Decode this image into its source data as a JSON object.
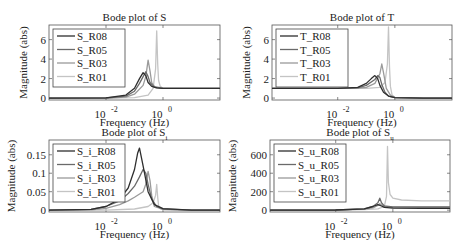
{
  "figure": {
    "background": "#ffffff",
    "series_colors": [
      "#2e2e2e",
      "#6a6a6a",
      "#9a9a9a",
      "#c4c4c4"
    ]
  },
  "chart_data": [
    {
      "type": "line",
      "id": "S",
      "title": "Bode plot of S",
      "xlabel": "Frequency  (Hz)",
      "ylabel": "Magnitude (abs)",
      "xscale": "log",
      "xlim": [
        0.0001,
        100
      ],
      "ylim": [
        -0.2,
        7.5
      ],
      "xticks": [
        {
          "value": 0.01,
          "label": "10",
          "exp": "-2"
        },
        {
          "value": 1,
          "label": "10",
          "exp": "0"
        }
      ],
      "yticks": [
        0,
        2,
        4,
        6
      ],
      "legend": [
        "S_R08",
        "S_R05",
        "S_R03",
        "S_R01"
      ],
      "legend_position": "upper left",
      "series": [
        {
          "name": "S_R08",
          "x": [
            0.0001,
            0.01,
            0.05,
            0.1,
            0.15,
            0.2,
            0.25,
            0.3,
            0.4,
            0.6,
            1,
            10,
            100
          ],
          "values": [
            0,
            0.02,
            0.3,
            1.0,
            2.0,
            2.6,
            2.3,
            1.6,
            1.2,
            1.05,
            1.0,
            1.0,
            1.0
          ]
        },
        {
          "name": "S_R05",
          "x": [
            0.0001,
            0.01,
            0.05,
            0.1,
            0.15,
            0.2,
            0.25,
            0.3,
            0.35,
            0.5,
            1,
            10,
            100
          ],
          "values": [
            0,
            0.01,
            0.2,
            0.7,
            1.5,
            2.2,
            2.7,
            2.2,
            1.6,
            1.1,
            1.0,
            1.0,
            1.0
          ]
        },
        {
          "name": "S_R03",
          "x": [
            0.0001,
            0.01,
            0.05,
            0.1,
            0.2,
            0.25,
            0.3,
            0.35,
            0.4,
            0.5,
            1,
            10,
            100
          ],
          "values": [
            0,
            0.01,
            0.1,
            0.4,
            1.3,
            2.2,
            3.9,
            2.8,
            1.6,
            1.2,
            1.0,
            1.0,
            1.0
          ]
        },
        {
          "name": "S_R01",
          "x": [
            0.0001,
            0.01,
            0.1,
            0.3,
            0.45,
            0.55,
            0.6,
            0.65,
            0.7,
            0.8,
            1,
            10,
            100
          ],
          "values": [
            0,
            0.0,
            0.05,
            0.3,
            1.0,
            3.0,
            6.9,
            3.5,
            1.8,
            1.2,
            1.0,
            1.0,
            1.0
          ]
        }
      ]
    },
    {
      "type": "line",
      "id": "T",
      "title": "Bode plot of T",
      "xlabel": "Frequency  (Hz)",
      "ylabel": "Magnitude (abs)",
      "xscale": "log",
      "xlim": [
        5e-05,
        100
      ],
      "ylim": [
        -0.2,
        7.5
      ],
      "xticks": [
        {
          "value": 0.01,
          "label": "10",
          "exp": "-2"
        },
        {
          "value": 1,
          "label": "10",
          "exp": "0"
        }
      ],
      "yticks": [
        0,
        2,
        4,
        6
      ],
      "legend": [
        "T_R08",
        "T_R05",
        "T_R03",
        "T_R01"
      ],
      "legend_position": "upper left",
      "series": [
        {
          "name": "T_R08",
          "x": [
            5e-05,
            0.01,
            0.05,
            0.1,
            0.15,
            0.2,
            0.25,
            0.3,
            0.4,
            0.6,
            1,
            10,
            100
          ],
          "values": [
            1.0,
            1.0,
            1.1,
            1.5,
            2.0,
            2.3,
            2.0,
            1.3,
            0.6,
            0.2,
            0.05,
            0,
            0
          ]
        },
        {
          "name": "T_R05",
          "x": [
            5e-05,
            0.01,
            0.05,
            0.1,
            0.2,
            0.25,
            0.3,
            0.35,
            0.45,
            0.6,
            1,
            10,
            100
          ],
          "values": [
            1.0,
            1.0,
            1.05,
            1.3,
            1.9,
            2.3,
            2.1,
            1.4,
            0.6,
            0.2,
            0.05,
            0,
            0
          ]
        },
        {
          "name": "T_R03",
          "x": [
            5e-05,
            0.01,
            0.05,
            0.1,
            0.2,
            0.3,
            0.35,
            0.4,
            0.5,
            0.7,
            1,
            10,
            100
          ],
          "values": [
            1.0,
            1.0,
            1.02,
            1.1,
            1.5,
            2.5,
            3.5,
            2.6,
            1.0,
            0.3,
            0.05,
            0,
            0
          ]
        },
        {
          "name": "T_R01",
          "x": [
            5e-05,
            0.01,
            0.1,
            0.3,
            0.45,
            0.55,
            0.6,
            0.65,
            0.7,
            0.8,
            1,
            10,
            100
          ],
          "values": [
            1.0,
            1.0,
            1.0,
            1.1,
            1.6,
            3.5,
            7.3,
            3.2,
            1.2,
            0.3,
            0.05,
            0,
            0
          ]
        }
      ]
    },
    {
      "type": "line",
      "id": "S_i",
      "title": "Bode plot of S",
      "title_subscript": "i",
      "xlabel": "Frequency  (Hz)",
      "ylabel": "Magnitude (abs)",
      "xscale": "log",
      "xlim": [
        0.0001,
        100
      ],
      "ylim": [
        -0.005,
        0.19
      ],
      "xticks": [
        {
          "value": 0.01,
          "label": "10",
          "exp": "-2"
        },
        {
          "value": 1,
          "label": "10",
          "exp": "0"
        }
      ],
      "yticks": [
        0,
        0.05,
        0.1,
        0.15
      ],
      "legend": [
        "S_i_R08",
        "S_i_R05",
        "S_i_R03",
        "S_i_R01"
      ],
      "legend_position": "upper left",
      "series": [
        {
          "name": "S_i_R08",
          "x": [
            0.0001,
            0.003,
            0.01,
            0.03,
            0.06,
            0.1,
            0.13,
            0.15,
            0.2,
            0.3,
            0.5,
            1,
            10,
            100
          ],
          "values": [
            0,
            0.002,
            0.01,
            0.03,
            0.06,
            0.11,
            0.155,
            0.168,
            0.12,
            0.05,
            0.015,
            0.004,
            0,
            0
          ]
        },
        {
          "name": "S_i_R05",
          "x": [
            0.0001,
            0.003,
            0.01,
            0.03,
            0.06,
            0.1,
            0.15,
            0.2,
            0.25,
            0.3,
            0.4,
            0.6,
            1,
            10,
            100
          ],
          "values": [
            0,
            0.002,
            0.01,
            0.025,
            0.045,
            0.065,
            0.09,
            0.11,
            0.1,
            0.07,
            0.03,
            0.01,
            0.003,
            0,
            0
          ]
        },
        {
          "name": "S_i_R03",
          "x": [
            0.0001,
            0.003,
            0.01,
            0.03,
            0.06,
            0.1,
            0.2,
            0.25,
            0.3,
            0.35,
            0.4,
            0.5,
            1,
            10,
            100
          ],
          "values": [
            0,
            0.001,
            0.005,
            0.015,
            0.025,
            0.035,
            0.05,
            0.07,
            0.105,
            0.08,
            0.04,
            0.01,
            0.002,
            0,
            0
          ]
        },
        {
          "name": "S_i_R01",
          "x": [
            0.0001,
            0.01,
            0.1,
            0.3,
            0.45,
            0.55,
            0.6,
            0.65,
            0.7,
            0.8,
            1,
            10,
            100
          ],
          "values": [
            0,
            0.0,
            0.003,
            0.01,
            0.02,
            0.04,
            0.07,
            0.035,
            0.012,
            0.004,
            0.001,
            0,
            0
          ]
        }
      ]
    },
    {
      "type": "line",
      "id": "S_u",
      "title": "Bode plot of S",
      "title_subscript": "u",
      "xlabel": "Frequency  (Hz)",
      "ylabel": "Magnitude (abs)",
      "xscale": "log",
      "xlim": [
        5e-05,
        100
      ],
      "ylim": [
        -20,
        760
      ],
      "xticks": [
        {
          "value": 0.01,
          "label": "10",
          "exp": "-2"
        },
        {
          "value": 1,
          "label": "10",
          "exp": "0"
        }
      ],
      "yticks": [
        0,
        200,
        400,
        600
      ],
      "legend": [
        "S_u_R08",
        "S_u_R05",
        "S_u_R03",
        "S_u_R01"
      ],
      "legend_position": "upper left",
      "series": [
        {
          "name": "S_u_R08",
          "x": [
            5e-05,
            0.01,
            0.1,
            0.2,
            0.3,
            0.4,
            0.5,
            1,
            10,
            100
          ],
          "values": [
            0,
            2,
            15,
            40,
            60,
            45,
            30,
            22,
            20,
            20
          ]
        },
        {
          "name": "S_u_R05",
          "x": [
            5e-05,
            0.01,
            0.1,
            0.2,
            0.3,
            0.35,
            0.4,
            0.5,
            1,
            10,
            100
          ],
          "values": [
            0,
            2,
            15,
            40,
            80,
            130,
            80,
            45,
            35,
            35,
            35
          ]
        },
        {
          "name": "S_u_R03",
          "x": [
            5e-05,
            0.01,
            0.1,
            0.2,
            0.3,
            0.35,
            0.45,
            0.6,
            1,
            10,
            100
          ],
          "values": [
            0,
            1,
            10,
            25,
            50,
            70,
            45,
            35,
            30,
            30,
            30
          ]
        },
        {
          "name": "S_u_R01",
          "x": [
            5e-05,
            0.01,
            0.1,
            0.3,
            0.5,
            0.6,
            0.65,
            0.7,
            0.8,
            1,
            2,
            10,
            100
          ],
          "values": [
            0,
            1,
            5,
            15,
            40,
            150,
            690,
            300,
            170,
            130,
            110,
            100,
            100
          ]
        }
      ]
    }
  ],
  "panels_layout": [
    {
      "axes": {
        "x": 49,
        "y": 25,
        "w": 171,
        "h": 75
      }
    },
    {
      "axes": {
        "x": 272,
        "y": 25,
        "w": 180,
        "h": 75
      }
    },
    {
      "axes": {
        "x": 49,
        "y": 140,
        "w": 171,
        "h": 72
      }
    },
    {
      "axes": {
        "x": 270,
        "y": 140,
        "w": 180,
        "h": 72
      }
    }
  ]
}
